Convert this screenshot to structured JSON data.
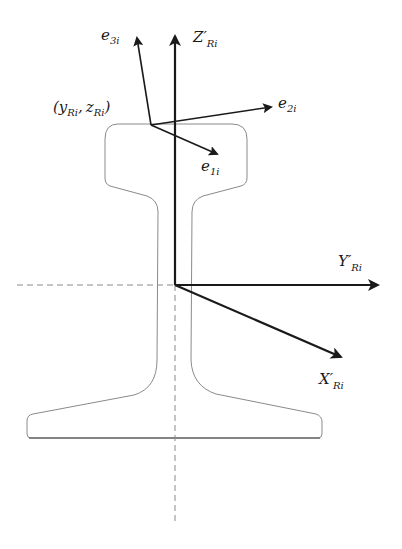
{
  "diagram": {
    "type": "rail-cross-section-coordinate-frames",
    "colors": {
      "background": "#ffffff",
      "axes": "#1a1a1a",
      "rail_outline": "#8a8a8a",
      "dashed_lines": "#8a8a8a",
      "labels": "#1a1a1a"
    },
    "labels": {
      "contact_point": {
        "open": "(",
        "y": "y",
        "y_sub": "Ri",
        "comma": ",",
        "z": "z",
        "z_sub": "Ri",
        "close": ")"
      },
      "e1": {
        "base": "e",
        "sub": "1i"
      },
      "e2": {
        "base": "e",
        "sub": "2i"
      },
      "e3": {
        "base": "e",
        "sub": "3i"
      },
      "z_axis": {
        "base": "Z′",
        "sub": "Ri"
      },
      "y_axis": {
        "base": "Y′",
        "sub": "Ri"
      },
      "x_axis": {
        "base": "X′",
        "sub": "Ri"
      }
    }
  }
}
